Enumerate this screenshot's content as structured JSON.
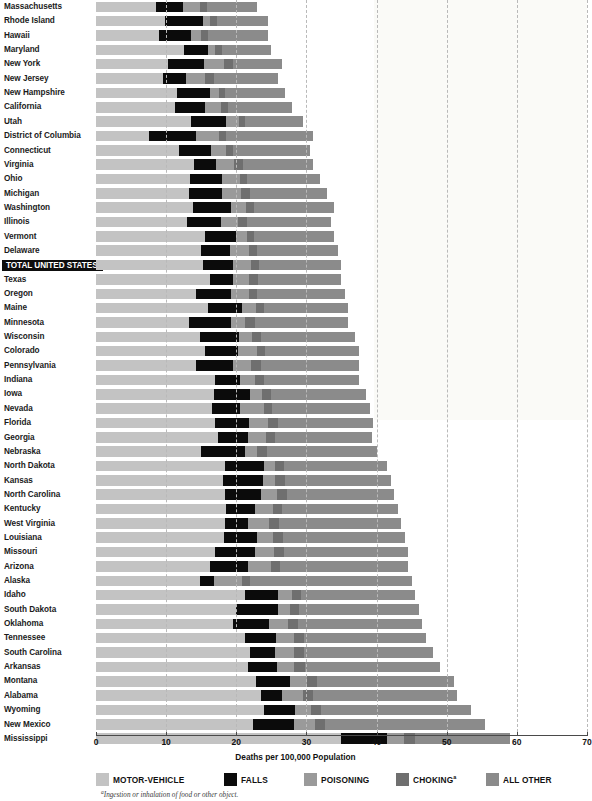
{
  "chart_data": {
    "type": "bar",
    "subtype": "horizontal-stacked",
    "title": "",
    "xlabel": "Deaths per 100,000 Population",
    "ylabel": "",
    "xlim": [
      0,
      70
    ],
    "xticks": [
      0,
      10,
      20,
      30,
      40,
      50,
      60,
      70
    ],
    "xtick_labels": [
      "0",
      "10",
      "20",
      "30",
      "40",
      "50",
      "60",
      "70"
    ],
    "grid": "vertical-dashed",
    "legend_position": "bottom",
    "footnote": "Ingestion or inhalation of food or other object.",
    "footnote_marker": "a",
    "series": [
      {
        "name": "MOTOR-VEHICLE",
        "color": "#c3c3c3",
        "key": "motor"
      },
      {
        "name": "FALLS",
        "color": "#0b0b0b",
        "key": "falls"
      },
      {
        "name": "POISONING",
        "color": "#9a9a9a",
        "key": "poison"
      },
      {
        "name": "CHOKING",
        "color": "#6f6f6f",
        "key": "choke",
        "marker": "a"
      },
      {
        "name": "ALL OTHER",
        "color": "#8b8b8b",
        "key": "other"
      }
    ],
    "categories": [
      "Massachusetts",
      "Rhode Island",
      "Hawaii",
      "Maryland",
      "New York",
      "New Jersey",
      "New Hampshire",
      "California",
      "Utah",
      "District of Columbia",
      "Connecticut",
      "Virginia",
      "Ohio",
      "Michigan",
      "Washington",
      "Illinois",
      "Vermont",
      "Delaware",
      "TOTAL UNITED STATES",
      "Texas",
      "Oregon",
      "Maine",
      "Minnesota",
      "Wisconsin",
      "Colorado",
      "Pennsylvania",
      "Indiana",
      "Iowa",
      "Nevada",
      "Florida",
      "Georgia",
      "Nebraska",
      "North Dakota",
      "Kansas",
      "North Carolina",
      "Kentucky",
      "West Virginia",
      "Louisiana",
      "Missouri",
      "Arizona",
      "Alaska",
      "Idaho",
      "South Dakota",
      "Oklahoma",
      "Tennessee",
      "South Carolina",
      "Arkansas",
      "Montana",
      "Alabama",
      "Wyoming",
      "New Mexico",
      "Mississippi"
    ],
    "rows": [
      {
        "state": "Massachusetts",
        "motor": 8.5,
        "falls": 3.9,
        "poison": 2.5,
        "choke": 0.9,
        "other": 7.2,
        "total": 23.0
      },
      {
        "state": "Rhode Island",
        "motor": 9.8,
        "falls": 5.4,
        "poison": 1.1,
        "choke": 1.0,
        "other": 7.2,
        "total": 24.5
      },
      {
        "state": "Hawaii",
        "motor": 9.0,
        "falls": 4.5,
        "poison": 1.4,
        "choke": 1.1,
        "other": 8.5,
        "total": 24.5
      },
      {
        "state": "Maryland",
        "motor": 12.5,
        "falls": 3.4,
        "poison": 1.1,
        "choke": 1.0,
        "other": 7.0,
        "total": 25.0
      },
      {
        "state": "New York",
        "motor": 10.2,
        "falls": 5.2,
        "poison": 2.9,
        "choke": 1.2,
        "other": 7.0,
        "total": 26.5
      },
      {
        "state": "New Jersey",
        "motor": 9.6,
        "falls": 3.2,
        "poison": 2.7,
        "choke": 1.3,
        "other": 9.2,
        "total": 26.0
      },
      {
        "state": "New Hampshire",
        "motor": 11.5,
        "falls": 4.8,
        "poison": 1.3,
        "choke": 0.8,
        "other": 8.5,
        "total": 26.9
      },
      {
        "state": "California",
        "motor": 11.3,
        "falls": 4.2,
        "poison": 2.3,
        "choke": 1.0,
        "other": 9.2,
        "total": 28.0
      },
      {
        "state": "Utah",
        "motor": 13.5,
        "falls": 5.0,
        "poison": 1.9,
        "choke": 0.9,
        "other": 8.2,
        "total": 29.5
      },
      {
        "state": "District of Columbia",
        "motor": 7.5,
        "falls": 6.8,
        "poison": 3.2,
        "choke": 1.1,
        "other": 12.4,
        "total": 31.0
      },
      {
        "state": "Connecticut",
        "motor": 11.8,
        "falls": 4.6,
        "poison": 2.1,
        "choke": 1.1,
        "other": 10.9,
        "total": 30.5
      },
      {
        "state": "Virginia",
        "motor": 14.0,
        "falls": 3.1,
        "poison": 2.6,
        "choke": 1.2,
        "other": 10.1,
        "total": 31.0
      },
      {
        "state": "Ohio",
        "motor": 13.4,
        "falls": 4.6,
        "poison": 2.5,
        "choke": 1.1,
        "other": 10.4,
        "total": 32.0
      },
      {
        "state": "Michigan",
        "motor": 13.2,
        "falls": 4.8,
        "poison": 2.7,
        "choke": 1.3,
        "other": 11.0,
        "total": 33.0
      },
      {
        "state": "Washington",
        "motor": 13.8,
        "falls": 5.4,
        "poison": 2.2,
        "choke": 1.2,
        "other": 11.4,
        "total": 34.0
      },
      {
        "state": "Illinois",
        "motor": 13.0,
        "falls": 4.8,
        "poison": 2.4,
        "choke": 1.3,
        "other": 12.0,
        "total": 33.5
      },
      {
        "state": "Vermont",
        "motor": 15.6,
        "falls": 4.3,
        "poison": 1.6,
        "choke": 1.1,
        "other": 11.4,
        "total": 34.0
      },
      {
        "state": "Delaware",
        "motor": 15.0,
        "falls": 4.1,
        "poison": 2.7,
        "choke": 1.2,
        "other": 11.5,
        "total": 34.5
      },
      {
        "state": "TOTAL UNITED STATES",
        "motor": 15.2,
        "falls": 4.3,
        "poison": 2.6,
        "choke": 1.2,
        "other": 11.7,
        "total": 35.0
      },
      {
        "state": "Texas",
        "motor": 16.2,
        "falls": 3.3,
        "poison": 2.3,
        "choke": 1.3,
        "other": 11.9,
        "total": 35.0
      },
      {
        "state": "Oregon",
        "motor": 14.2,
        "falls": 5.1,
        "poison": 2.5,
        "choke": 1.2,
        "other": 12.5,
        "total": 35.5
      },
      {
        "state": "Maine",
        "motor": 16.0,
        "falls": 4.8,
        "poison": 2.0,
        "choke": 1.2,
        "other": 12.0,
        "total": 36.0
      },
      {
        "state": "Minnesota",
        "motor": 13.2,
        "falls": 6.1,
        "poison": 2.0,
        "choke": 1.4,
        "other": 13.3,
        "total": 36.0
      },
      {
        "state": "Wisconsin",
        "motor": 14.8,
        "falls": 5.6,
        "poison": 1.9,
        "choke": 1.3,
        "other": 13.4,
        "total": 37.0
      },
      {
        "state": "Colorado",
        "motor": 15.6,
        "falls": 4.6,
        "poison": 2.8,
        "choke": 1.1,
        "other": 13.4,
        "total": 37.5
      },
      {
        "state": "Pennsylvania",
        "motor": 14.2,
        "falls": 5.3,
        "poison": 2.6,
        "choke": 1.4,
        "other": 14.0,
        "total": 37.5
      },
      {
        "state": "Indiana",
        "motor": 17.0,
        "falls": 3.6,
        "poison": 2.1,
        "choke": 1.3,
        "other": 13.5,
        "total": 37.5
      },
      {
        "state": "Iowa",
        "motor": 16.8,
        "falls": 5.2,
        "poison": 1.6,
        "choke": 1.3,
        "other": 13.6,
        "total": 38.5
      },
      {
        "state": "Nevada",
        "motor": 16.5,
        "falls": 4.1,
        "poison": 3.3,
        "choke": 1.2,
        "other": 13.9,
        "total": 39.0
      },
      {
        "state": "Florida",
        "motor": 16.9,
        "falls": 4.9,
        "poison": 2.7,
        "choke": 1.4,
        "other": 13.6,
        "total": 39.5
      },
      {
        "state": "Georgia",
        "motor": 17.4,
        "falls": 4.3,
        "poison": 2.5,
        "choke": 1.3,
        "other": 13.8,
        "total": 39.3
      },
      {
        "state": "Nebraska",
        "motor": 15.0,
        "falls": 6.2,
        "poison": 1.8,
        "choke": 1.4,
        "other": 15.6,
        "total": 40.0
      },
      {
        "state": "North Dakota",
        "motor": 18.4,
        "falls": 5.5,
        "poison": 1.6,
        "choke": 1.3,
        "other": 14.7,
        "total": 41.5
      },
      {
        "state": "Kansas",
        "motor": 18.1,
        "falls": 5.7,
        "poison": 1.7,
        "choke": 1.4,
        "other": 15.1,
        "total": 42.0
      },
      {
        "state": "North Carolina",
        "motor": 18.4,
        "falls": 5.1,
        "poison": 2.3,
        "choke": 1.4,
        "other": 15.3,
        "total": 42.5
      },
      {
        "state": "Kentucky",
        "motor": 18.5,
        "falls": 4.1,
        "poison": 2.6,
        "choke": 1.3,
        "other": 16.5,
        "total": 43.0
      },
      {
        "state": "West Virginia",
        "motor": 18.4,
        "falls": 3.3,
        "poison": 3.0,
        "choke": 1.4,
        "other": 17.4,
        "total": 43.5
      },
      {
        "state": "Louisiana",
        "motor": 18.2,
        "falls": 4.8,
        "poison": 2.3,
        "choke": 1.4,
        "other": 17.3,
        "total": 44.0
      },
      {
        "state": "Missouri",
        "motor": 17.0,
        "falls": 5.6,
        "poison": 2.8,
        "choke": 1.4,
        "other": 17.7,
        "total": 44.5
      },
      {
        "state": "Arizona",
        "motor": 16.2,
        "falls": 5.5,
        "poison": 3.2,
        "choke": 1.3,
        "other": 18.3,
        "total": 44.5
      },
      {
        "state": "Alaska",
        "motor": 14.8,
        "falls": 2.0,
        "poison": 4.0,
        "choke": 1.2,
        "other": 23.0,
        "total": 45.0
      },
      {
        "state": "Idaho",
        "motor": 21.3,
        "falls": 4.6,
        "poison": 2.0,
        "choke": 1.3,
        "other": 16.3,
        "total": 45.5
      },
      {
        "state": "South Dakota",
        "motor": 20.0,
        "falls": 6.0,
        "poison": 1.7,
        "choke": 1.3,
        "other": 17.0,
        "total": 46.0
      },
      {
        "state": "Oklahoma",
        "motor": 19.6,
        "falls": 5.0,
        "poison": 2.8,
        "choke": 1.4,
        "other": 17.7,
        "total": 46.5
      },
      {
        "state": "Tennessee",
        "motor": 21.2,
        "falls": 4.5,
        "poison": 2.6,
        "choke": 1.4,
        "other": 17.3,
        "total": 47.0
      },
      {
        "state": "South Carolina",
        "motor": 22.0,
        "falls": 3.5,
        "poison": 2.7,
        "choke": 1.4,
        "other": 18.4,
        "total": 48.0
      },
      {
        "state": "Arkansas",
        "motor": 21.6,
        "falls": 4.2,
        "poison": 2.5,
        "choke": 1.5,
        "other": 19.2,
        "total": 49.0
      },
      {
        "state": "Montana",
        "motor": 22.8,
        "falls": 4.9,
        "poison": 2.4,
        "choke": 1.4,
        "other": 19.5,
        "total": 51.0
      },
      {
        "state": "Alabama",
        "motor": 23.5,
        "falls": 3.0,
        "poison": 3.0,
        "choke": 1.5,
        "other": 20.5,
        "total": 51.5
      },
      {
        "state": "Wyoming",
        "motor": 24.0,
        "falls": 4.4,
        "poison": 2.3,
        "choke": 1.4,
        "other": 21.4,
        "total": 53.5
      },
      {
        "state": "New Mexico",
        "motor": 22.4,
        "falls": 5.8,
        "poison": 3.0,
        "choke": 1.5,
        "other": 22.8,
        "total": 55.5
      },
      {
        "state": "Mississippi",
        "motor": 35.0,
        "falls": 6.5,
        "poison": 2.4,
        "choke": 1.6,
        "other": 13.5,
        "total": 59.0
      }
    ]
  }
}
